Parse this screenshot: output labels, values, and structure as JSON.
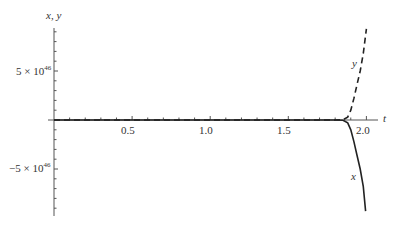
{
  "chart_data": {
    "type": "line",
    "title": "",
    "xlabel": "t",
    "ylabel": "x, y",
    "xlim": [
      0,
      2.05
    ],
    "ylim": [
      -9e+46,
      9e+46
    ],
    "grid": false,
    "legend": "inline curve labels",
    "x_ticks": [
      {
        "value": 0.5,
        "label": "0.5"
      },
      {
        "value": 1.0,
        "label": "1.0"
      },
      {
        "value": 1.5,
        "label": "1.5"
      },
      {
        "value": 2.0,
        "label": "2.0"
      }
    ],
    "y_ticks": [
      {
        "value": 5e+46,
        "label_base": "5 × 10",
        "label_exp": "46"
      },
      {
        "value": -5e+46,
        "label_base": "−5 × 10",
        "label_exp": "46"
      }
    ],
    "series": [
      {
        "name": "x",
        "style": "solid",
        "t": [
          0,
          0.5,
          1.0,
          1.5,
          1.8,
          1.85,
          1.88,
          1.9,
          1.92,
          1.94,
          1.96,
          1.98,
          1.995
        ],
        "values": [
          0,
          0,
          0,
          0,
          0,
          -3e+44,
          -3e+45,
          -1e+46,
          -2.2e+46,
          -3.6e+46,
          -5e+46,
          -6.8e+46,
          -9.3e+46
        ]
      },
      {
        "name": "y",
        "style": "dashed",
        "t": [
          0,
          0.5,
          1.0,
          1.5,
          1.8,
          1.85,
          1.88,
          1.9,
          1.92,
          1.94,
          1.96,
          1.98,
          2.0
        ],
        "values": [
          0,
          0,
          0,
          0,
          0,
          3e+44,
          3e+45,
          1e+46,
          2.2e+46,
          3.6e+46,
          5e+46,
          6.8e+46,
          9.3e+46
        ]
      }
    ],
    "annotations": [
      {
        "text": "y",
        "near_series": "y"
      },
      {
        "text": "x",
        "near_series": "x"
      }
    ]
  },
  "labels": {
    "y_axis": "x, y",
    "x_axis": "t",
    "x_tick_05": "0.5",
    "x_tick_10": "1.0",
    "x_tick_15": "1.5",
    "x_tick_20": "2.0",
    "y_tick_pos_base": "5 × 10",
    "y_tick_pos_exp": "46",
    "y_tick_neg_base": "−5 × 10",
    "y_tick_neg_exp": "46",
    "curve_y": "y",
    "curve_x": "x"
  },
  "colors": {
    "axis": "#555555",
    "curve": "#222222"
  }
}
